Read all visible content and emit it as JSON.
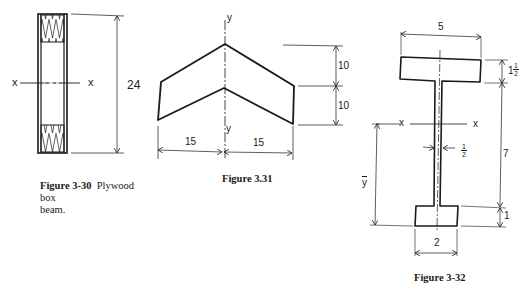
{
  "figures": [
    {
      "id": "3-30",
      "caption_number": "Figure 3-30",
      "caption_text": "Plywood box beam.",
      "caption_line1": "Plywood box",
      "caption_line2": "beam.",
      "axis_left_label": "x",
      "axis_right_label": "x",
      "height_dimension": "24"
    },
    {
      "id": "3.31",
      "caption_number": "Figure 3.31",
      "axis_top_label": "y",
      "axis_bottom_label": "y",
      "width_left_dimension": "15",
      "width_right_dimension": "15",
      "height_upper_dimension": "10",
      "height_lower_dimension": "10"
    },
    {
      "id": "3-32",
      "caption_number": "Figure 3-32",
      "flange_width_dimension": "5",
      "flange_thickness_whole": "1",
      "flange_thickness_num": "1",
      "flange_thickness_den": "2",
      "web_height_dimension": "7",
      "web_thickness_num": "1",
      "web_thickness_den": "2",
      "bottom_flange_thickness_dimension": "1",
      "bottom_flange_width_dimension": "2",
      "centroid_label": "y",
      "axis_left_label": "x",
      "axis_right_label": "x"
    }
  ],
  "colors": {
    "ink": "#1a1a1a",
    "background": "#ffffff"
  }
}
